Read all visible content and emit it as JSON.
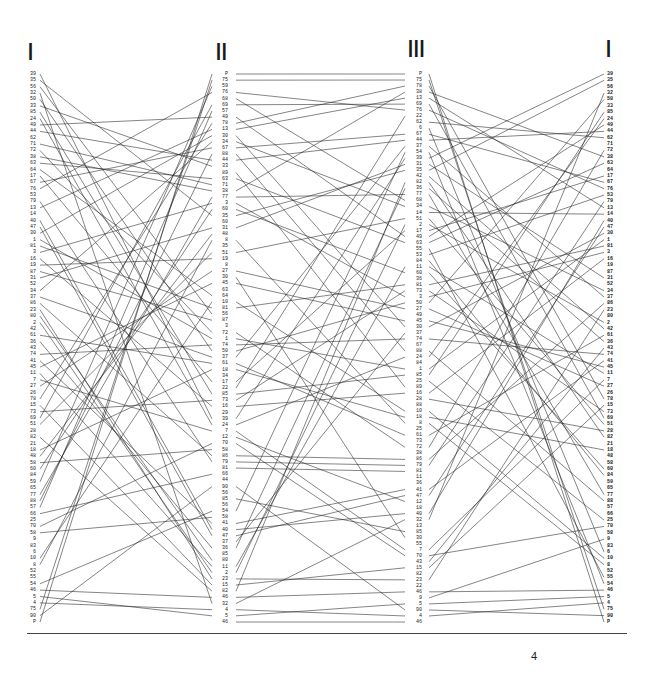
{
  "columns": [
    {
      "id": "I_left",
      "header": "I",
      "x_label": 24,
      "x_line": 41,
      "align": "left"
    },
    {
      "id": "II",
      "header": "II",
      "x_label": 215,
      "x_line": 232,
      "align": "mid"
    },
    {
      "id": "III",
      "header": "III",
      "x_label": 408,
      "x_line": 425,
      "align": "mid"
    },
    {
      "id": "I_right",
      "header": "I",
      "x_label": 608,
      "x_line": 605,
      "align": "right"
    }
  ],
  "headers": {
    "I_left": "I",
    "II": "II",
    "III": "III",
    "I_right": "I"
  },
  "rows": {
    "top_y": 74,
    "step": 6.0
  },
  "labels": {
    "I": [
      "39",
      "35",
      "56",
      "32",
      "50",
      "33",
      "85",
      "24",
      "49",
      "44",
      "62",
      "71",
      "72",
      "38",
      "63",
      "64",
      "17",
      "67",
      "76",
      "53",
      "79",
      "13",
      "14",
      "40",
      "47",
      "30",
      "1",
      "81",
      "3",
      "16",
      "19",
      "87",
      "31",
      "52",
      "34",
      "37",
      "86",
      "23",
      "80",
      "2",
      "42",
      "61",
      "36",
      "43",
      "74",
      "41",
      "45",
      "11",
      "7",
      "27",
      "26",
      "78",
      "15",
      "73",
      "69",
      "51",
      "28",
      "82",
      "21",
      "18",
      "48",
      "58",
      "60",
      "84",
      "59",
      "65",
      "77",
      "88",
      "57",
      "66",
      "25",
      "70",
      "58",
      "9",
      "83",
      "6",
      "10",
      "8",
      "52",
      "55",
      "54",
      "46",
      "5",
      "4",
      "75",
      "90",
      "P"
    ],
    "II": [
      "P",
      "75",
      "59",
      "76",
      "68",
      "69",
      "57",
      "49",
      "78",
      "13",
      "30",
      "34",
      "67",
      "88",
      "44",
      "33",
      "89",
      "63",
      "71",
      "38",
      "77",
      "3",
      "60",
      "35",
      "60",
      "31",
      "48",
      "8",
      "35",
      "51",
      "19",
      "8",
      "27",
      "30",
      "45",
      "63",
      "64",
      "10",
      "81",
      "56",
      "87",
      "3",
      "72",
      "1",
      "74",
      "50",
      "37",
      "61",
      "18",
      "34",
      "17",
      "22",
      "85",
      "73",
      "16",
      "29",
      "39",
      "24",
      "7",
      "12",
      "70",
      "58",
      "86",
      "79",
      "81",
      "66",
      "44",
      "90",
      "56",
      "85",
      "56",
      "54",
      "58",
      "41",
      "40",
      "47",
      "37",
      "36",
      "85",
      "80",
      "11",
      "2",
      "23",
      "15",
      "82",
      "46",
      "32",
      "4",
      "5",
      "46"
    ],
    "III": [
      "P",
      "75",
      "78",
      "38",
      "13",
      "69",
      "76",
      "22",
      "62",
      "6",
      "67",
      "44",
      "37",
      "54",
      "39",
      "31",
      "35",
      "42",
      "82",
      "36",
      "77",
      "68",
      "34",
      "14",
      "51",
      "2",
      "17",
      "49",
      "63",
      "55",
      "53",
      "84",
      "11",
      "60",
      "36",
      "81",
      "73",
      "3",
      "50",
      "27",
      "49",
      "45",
      "30",
      "37",
      "74",
      "67",
      "88",
      "24",
      "84",
      "1",
      "85",
      "25",
      "89",
      "16",
      "28",
      "88",
      "10",
      "18",
      "8",
      "25",
      "61",
      "73",
      "72",
      "38",
      "86",
      "79",
      "81",
      "11",
      "36",
      "41",
      "47",
      "12",
      "18",
      "40",
      "32",
      "13",
      "85",
      "30",
      "55",
      "7",
      "70",
      "43",
      "15",
      "82",
      "23",
      "22",
      "46",
      "9",
      "5",
      "90",
      "4",
      "46"
    ]
  },
  "connections_note": "Lines connect identical labels between adjacent columns (I→II, II→III, III→I)",
  "footer": {
    "page_number": "4"
  },
  "colors": {
    "line": "#1f1f1f",
    "text": "#222222",
    "background": "#ffffff",
    "rule": "#444444"
  }
}
